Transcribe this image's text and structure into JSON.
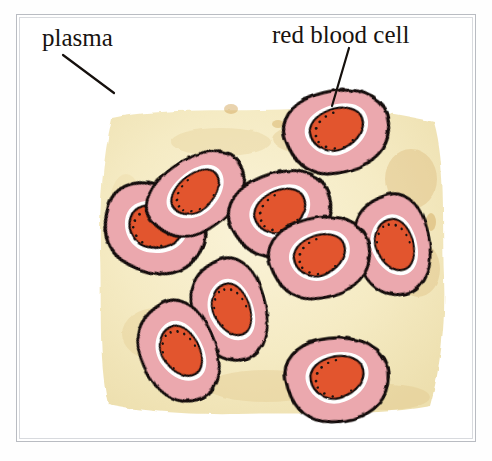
{
  "figure": {
    "title_sliver": "",
    "type": "illustration",
    "background_color": "#ffffff",
    "frame": {
      "outer_color": "#b9bcc2",
      "inner_color": "#d8dade",
      "x": 16,
      "y": 14,
      "width": 460,
      "height": 428
    },
    "plasma": {
      "name": "plasma",
      "fill_color": "#f6edc8",
      "mottle_color": "#e8d49a",
      "stain_color": "#ddbc7e"
    },
    "cell_style": {
      "outline_color": "#100c0a",
      "membrane_color": "#eba8ae",
      "membrane_shade": "#e193a1",
      "highlight_color": "#ffffff",
      "center_color": "#e2542f",
      "center_shade": "#c8421f",
      "stipple_color": "#1a1210"
    },
    "labels": [
      {
        "id": "plasma",
        "text": "plasma",
        "x": 42,
        "y": 24,
        "leader": {
          "x1": 63,
          "y1": 55,
          "x2": 114,
          "y2": 93
        }
      },
      {
        "id": "red-blood-cell",
        "text": "red blood cell",
        "x": 272,
        "y": 21,
        "leader": {
          "x1": 349,
          "y1": 48,
          "x2": 332,
          "y2": 106
        }
      }
    ],
    "cells": [
      {
        "id": "cell-top-right",
        "cx": 320,
        "cy": 117,
        "rx": 52,
        "ry": 42,
        "rot": -14
      },
      {
        "id": "cell-upper-left-back",
        "cx": 137,
        "cy": 215,
        "rx": 50,
        "ry": 42,
        "rot": 22
      },
      {
        "id": "cell-upper-left-front",
        "cx": 178,
        "cy": 183,
        "rx": 48,
        "ry": 36,
        "rot": -36
      },
      {
        "id": "cell-middle-left",
        "cx": 264,
        "cy": 200,
        "rx": 50,
        "ry": 40,
        "rot": -22
      },
      {
        "id": "cell-middle-right",
        "cx": 303,
        "cy": 242,
        "rx": 48,
        "ry": 38,
        "rot": -16
      },
      {
        "id": "cell-right-edge",
        "cx": 375,
        "cy": 230,
        "rx": 38,
        "ry": 46,
        "rot": 6
      },
      {
        "id": "cell-lower-mid",
        "cx": 213,
        "cy": 295,
        "rx": 38,
        "ry": 48,
        "rot": 10
      },
      {
        "id": "cell-lower-left",
        "cx": 163,
        "cy": 336,
        "rx": 38,
        "ry": 48,
        "rot": -6
      },
      {
        "id": "cell-bottom-right",
        "cx": 320,
        "cy": 365,
        "rx": 46,
        "ry": 40,
        "rot": -8
      }
    ],
    "cell_count": 9
  }
}
